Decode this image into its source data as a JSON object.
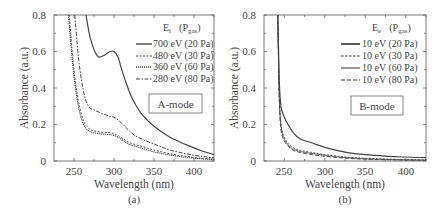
{
  "chart_data": [
    {
      "panel_label": "(a)",
      "type": "line",
      "title": "",
      "xlabel": "Wavelength (nm)",
      "ylabel": "Absorbance (a.u.)",
      "xlim": [
        225,
        425
      ],
      "ylim": [
        0,
        0.8
      ],
      "xticks": [
        250,
        300,
        350,
        400
      ],
      "yticks": [
        0,
        0.2,
        0.4,
        0.6,
        0.8
      ],
      "ytick_labels": [
        "0",
        "0.2",
        "0.4",
        "0.6",
        "0.8"
      ],
      "grid": false,
      "legend_header": "E_i (P_gas)",
      "legend_position": "upper right",
      "annotation": "A-mode",
      "series": [
        {
          "name": "700 eV (20 Pa)",
          "style": "solid",
          "x": [
            265,
            270,
            276,
            281,
            288,
            295,
            300,
            305,
            309,
            315,
            321,
            328,
            336,
            350,
            370,
            390,
            410,
            425
          ],
          "y": [
            0.8,
            0.68,
            0.6,
            0.57,
            0.58,
            0.6,
            0.6,
            0.57,
            0.51,
            0.43,
            0.36,
            0.3,
            0.25,
            0.19,
            0.13,
            0.09,
            0.055,
            0.035
          ]
        },
        {
          "name": "480 eV (30 Pa)",
          "style": "dashed",
          "x": [
            244,
            250,
            256,
            262,
            268,
            275,
            285,
            295,
            300,
            305,
            312,
            320,
            335,
            350,
            370,
            390,
            410,
            425
          ],
          "y": [
            0.8,
            0.5,
            0.32,
            0.22,
            0.18,
            0.165,
            0.158,
            0.155,
            0.15,
            0.14,
            0.12,
            0.1,
            0.08,
            0.06,
            0.04,
            0.025,
            0.015,
            0.01
          ]
        },
        {
          "name": "360 eV (60 Pa)",
          "style": "dotted",
          "x": [
            243,
            249,
            255,
            261,
            267,
            275,
            285,
            295,
            300,
            305,
            312,
            320,
            335,
            350,
            370,
            390,
            410,
            425
          ],
          "y": [
            0.8,
            0.5,
            0.31,
            0.21,
            0.17,
            0.155,
            0.148,
            0.145,
            0.14,
            0.13,
            0.11,
            0.09,
            0.07,
            0.05,
            0.033,
            0.02,
            0.012,
            0.008
          ]
        },
        {
          "name": "280 eV (80 Pa)",
          "style": "dash-dot",
          "x": [
            251,
            256,
            262,
            268,
            275,
            285,
            295,
            300,
            305,
            310,
            318,
            326,
            340,
            355,
            370,
            390,
            410,
            425
          ],
          "y": [
            0.8,
            0.55,
            0.38,
            0.3,
            0.28,
            0.26,
            0.245,
            0.24,
            0.225,
            0.205,
            0.17,
            0.14,
            0.11,
            0.085,
            0.06,
            0.04,
            0.025,
            0.018
          ]
        }
      ]
    },
    {
      "panel_label": "(b)",
      "type": "line",
      "title": "",
      "xlabel": "Wavelength (nm)",
      "ylabel": "Absorbance (a.u.)",
      "xlim": [
        225,
        425
      ],
      "ylim": [
        0,
        0.8
      ],
      "xticks": [
        250,
        300,
        350,
        400
      ],
      "yticks": [
        0,
        0.2,
        0.4,
        0.6,
        0.8
      ],
      "ytick_labels": [
        "0",
        "0.2",
        "0.4",
        "0.6",
        "0.8"
      ],
      "grid": false,
      "legend_header": "E_e (P_gas)",
      "legend_position": "upper right",
      "annotation": "B-mode",
      "series": [
        {
          "name": "10 eV (20 Pa)",
          "style": "solid",
          "x": [
            242,
            243,
            244,
            246,
            250,
            256,
            262,
            270,
            280,
            290,
            300,
            315,
            330,
            350,
            375,
            400,
            425
          ],
          "y": [
            0.8,
            0.6,
            0.42,
            0.3,
            0.24,
            0.19,
            0.15,
            0.12,
            0.105,
            0.09,
            0.075,
            0.058,
            0.045,
            0.035,
            0.027,
            0.022,
            0.018
          ]
        },
        {
          "name": "10 eV (30 Pa)",
          "style": "dashed",
          "x": [
            242,
            243,
            244,
            246,
            250,
            256,
            262,
            270,
            280,
            290,
            300,
            315,
            330,
            350,
            375,
            400,
            425
          ],
          "y": [
            0.8,
            0.55,
            0.35,
            0.2,
            0.13,
            0.09,
            0.07,
            0.058,
            0.05,
            0.042,
            0.035,
            0.027,
            0.02,
            0.015,
            0.011,
            0.008,
            0.006
          ]
        },
        {
          "name": "10 eV (60 Pa)",
          "style": "solid-thin",
          "x": [
            242,
            243,
            244,
            246,
            250,
            256,
            262,
            270,
            280,
            290,
            300,
            315,
            330,
            350,
            375,
            400,
            425
          ],
          "y": [
            0.8,
            0.54,
            0.33,
            0.19,
            0.12,
            0.082,
            0.063,
            0.052,
            0.044,
            0.037,
            0.031,
            0.023,
            0.017,
            0.012,
            0.009,
            0.006,
            0.005
          ]
        },
        {
          "name": "10 eV (80 Pa)",
          "style": "long-dash",
          "x": [
            242,
            243,
            244,
            246,
            250,
            256,
            262,
            270,
            280,
            290,
            300,
            315,
            330,
            350,
            375,
            400,
            425
          ],
          "y": [
            0.8,
            0.52,
            0.31,
            0.17,
            0.11,
            0.075,
            0.057,
            0.046,
            0.038,
            0.031,
            0.026,
            0.019,
            0.014,
            0.01,
            0.007,
            0.005,
            0.004
          ]
        }
      ]
    }
  ],
  "panels": [
    {
      "label": "(a)",
      "xlabel": "Wavelength (nm)",
      "ylabel": "Absorbance (a.u.)",
      "xtick_labels": [
        "250",
        "300",
        "350",
        "400"
      ],
      "ytick_labels": [
        "0",
        "0.2",
        "0.4",
        "0.6",
        "0.8"
      ],
      "legend_header_main": "E",
      "legend_header_sub": "i",
      "legend_pgas_main": "(P",
      "legend_pgas_sub": "gas",
      "legend_pgas_close": ")",
      "legend": [
        "700 eV (20 Pa)",
        "480 eV (30 Pa)",
        "360 eV (60 Pa)",
        "280 eV (80 Pa)"
      ],
      "mode": "A-mode"
    },
    {
      "label": "(b)",
      "xlabel": "Wavelength (nm)",
      "ylabel": "Absorbance (a.u.)",
      "xtick_labels": [
        "250",
        "300",
        "350",
        "400"
      ],
      "ytick_labels": [
        "0",
        "0.2",
        "0.4",
        "0.6",
        "0.8"
      ],
      "legend_header_main": "E",
      "legend_header_sub": "e",
      "legend_pgas_main": "(P",
      "legend_pgas_sub": "gas",
      "legend_pgas_close": ")",
      "legend": [
        "10 eV (20 Pa)",
        "10 eV (30 Pa)",
        "10 eV (60 Pa)",
        "10 eV (80 Pa)"
      ],
      "mode": "B-mode"
    }
  ],
  "colors": {
    "line": "#444444",
    "axis": "#555555",
    "text": "#444444",
    "background": "#ffffff"
  }
}
